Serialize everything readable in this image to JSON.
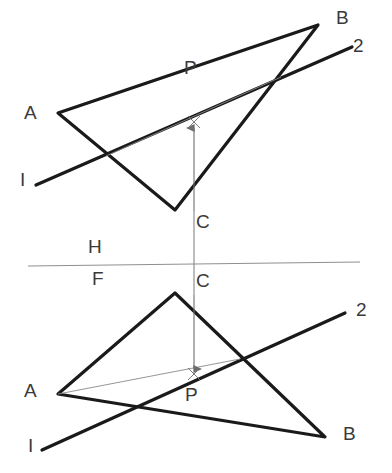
{
  "drawing": {
    "title": "Orthographic two-view projection: piercing point of a line and a plane",
    "canvas": {
      "width": 392,
      "height": 473,
      "background": "#ffffff"
    },
    "styles": {
      "heavy_stroke": "#1a1a1a",
      "heavy_width": 3.2,
      "light_stroke": "#8a8a8a",
      "light_width": 0.9,
      "reference_stroke": "#8f8f8f",
      "reference_width": 1.1,
      "label_color": "#3a3a3a",
      "label_size": "19px"
    },
    "reference_line": {
      "name": "H-F fold line",
      "upper_label": "H",
      "lower_label": "F",
      "x1": 28,
      "y1": 266,
      "x2": 360,
      "y2": 262
    },
    "top_view": {
      "name": "horizontal projection (top view)",
      "triangle": {
        "label": "triangle-ABC-top",
        "points": "58,113 318,25 175,210",
        "vertices": [
          {
            "id": "A",
            "label": "A",
            "x": 58,
            "y": 113,
            "label_x": 24,
            "label_y": 103
          },
          {
            "id": "B",
            "label": "B",
            "x": 318,
            "y": 25,
            "label_x": 336,
            "label_y": 8
          },
          {
            "id": "C",
            "label": "C",
            "x": 175,
            "y": 210,
            "label_x": 196,
            "label_y": 212
          }
        ]
      },
      "line_12": {
        "label": "line-1-2-top",
        "x1": 36,
        "y1": 185,
        "x2": 352,
        "y2": 47,
        "end_labels": [
          {
            "id": "1",
            "label": "I",
            "x": 20,
            "y": 170
          },
          {
            "id": "2",
            "label": "2",
            "x": 353,
            "y": 36
          }
        ]
      },
      "trace_line": {
        "label": "cutting-plane-trace-top",
        "x1": 106,
        "y1": 156,
        "x2": 281,
        "y2": 77
      },
      "projector": {
        "label": "projector-C-to-P-top",
        "x1": 194,
        "y1": 211,
        "x2": 194,
        "y2": 124,
        "arrow_at": "top"
      },
      "piercing_point": {
        "id": "P",
        "label": "P",
        "x": 194,
        "y": 122,
        "label_x": 184,
        "label_y": 90
      }
    },
    "front_view": {
      "name": "frontal projection (front view)",
      "triangle": {
        "label": "triangle-ABC-front",
        "points": "58,394 175,293 325,437",
        "vertices": [
          {
            "id": "A",
            "label": "A",
            "x": 58,
            "y": 394,
            "label_x": 24,
            "label_y": 381
          },
          {
            "id": "B",
            "label": "B",
            "x": 325,
            "y": 437,
            "label_x": 343,
            "label_y": 424
          },
          {
            "id": "C",
            "label": "C",
            "x": 175,
            "y": 293,
            "label_x": 196,
            "label_y": 271
          }
        ]
      },
      "line_12": {
        "label": "line-1-2-front",
        "x1": 42,
        "y1": 450,
        "x2": 345,
        "y2": 313,
        "end_labels": [
          {
            "id": "1",
            "label": "I",
            "x": 28,
            "y": 436
          },
          {
            "id": "2",
            "label": "2",
            "x": 356,
            "y": 300
          }
        ]
      },
      "trace_line": {
        "label": "cutting-plane-trace-front",
        "x1": 58,
        "y1": 394,
        "x2": 240,
        "y2": 359
      },
      "projector": {
        "label": "projector-C-to-P-front",
        "x1": 194,
        "y1": 295,
        "x2": 194,
        "y2": 373,
        "arrow_at": "bottom"
      },
      "piercing_point": {
        "id": "P",
        "label": "P",
        "x": 194,
        "y": 374,
        "label_x": 185,
        "label_y": 380
      }
    },
    "vertical_projector": {
      "label": "vertical-alignment-projector",
      "x1": 194,
      "y1": 211,
      "x2": 194,
      "y2": 295
    }
  }
}
